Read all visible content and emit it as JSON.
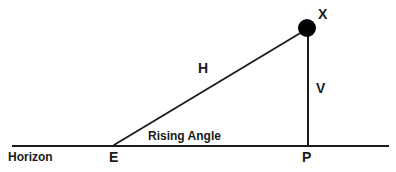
{
  "diagram": {
    "colors": {
      "stroke": "#1a1a1a",
      "marker_fill": "#000000",
      "background": "#ffffff"
    },
    "labels": {
      "point_x": "X",
      "hypotenuse": "H",
      "vertical": "V",
      "rising_angle": "Rising Angle",
      "horizon": "Horizon",
      "point_e": "E",
      "point_p": "P"
    },
    "geometry": {
      "horizon_line": {
        "x1": 12,
        "y1": 146,
        "x2": 389,
        "y2": 146
      },
      "vertical_line": {
        "x1": 308,
        "y1": 34,
        "x2": 308,
        "y2": 146
      },
      "hypotenuse_line": {
        "x1": 114,
        "y1": 145,
        "x2": 307,
        "y2": 29
      },
      "marker_x": {
        "cx": 307,
        "cy": 28,
        "r": 9
      },
      "vertex_e": {
        "x": 114,
        "y": 146
      },
      "vertex_p": {
        "x": 308,
        "y": 146
      }
    }
  }
}
